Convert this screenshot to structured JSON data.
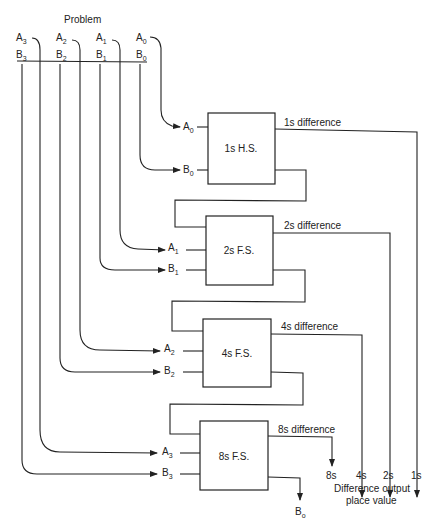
{
  "title": "Problem",
  "top_inputs": [
    {
      "a": "A",
      "b": "B",
      "sub": "3",
      "ax": 16,
      "bx": 16
    },
    {
      "a": "A",
      "b": "B",
      "sub": "2",
      "ax": 56,
      "bx": 56
    },
    {
      "a": "A",
      "b": "B",
      "sub": "1",
      "ax": 96,
      "bx": 96
    },
    {
      "a": "A",
      "b": "B",
      "sub": "0",
      "ax": 136,
      "bx": 136
    }
  ],
  "stages": [
    {
      "label": "1s H.S.",
      "a_in": "A",
      "b_in": "B",
      "sub": "0",
      "diff_label": "1s difference",
      "x": 208,
      "y": 113,
      "w": 67,
      "h": 71
    },
    {
      "label": "2s F.S.",
      "a_in": "A",
      "b_in": "B",
      "sub": "1",
      "diff_label": "2s difference",
      "x": 206,
      "y": 216,
      "w": 67,
      "h": 69
    },
    {
      "label": "4s F.S.",
      "a_in": "A",
      "b_in": "B",
      "sub": "2",
      "diff_label": "4s difference",
      "x": 203,
      "y": 319,
      "w": 68,
      "h": 68
    },
    {
      "label": "8s F.S.",
      "a_in": "A",
      "b_in": "B",
      "sub": "3",
      "diff_label": "8s difference",
      "x": 200,
      "y": 421,
      "w": 68,
      "h": 69
    }
  ],
  "outputs": {
    "place_values": [
      "8s",
      "4s",
      "2s",
      "1s"
    ],
    "caption_line1": "Difference output",
    "caption_line2": "place value"
  },
  "borrow_out": {
    "label": "B",
    "sub": "o"
  },
  "colors": {
    "line": "#222222",
    "background": "#ffffff"
  }
}
